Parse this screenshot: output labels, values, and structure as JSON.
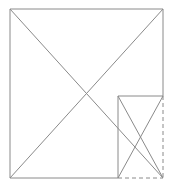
{
  "canvas": {
    "width": 172,
    "height": 188,
    "background": "#ffffff"
  },
  "style": {
    "stroke_color": "#8a8a8a",
    "stroke_width": 1,
    "dash_pattern": "4 3"
  },
  "diagram": {
    "big_rect": {
      "x1": 10,
      "y1": 9,
      "x2": 163,
      "y2": 178
    },
    "small_rect": {
      "x1": 118,
      "y1": 96,
      "x2": 163,
      "y2": 178
    },
    "lines": [
      {
        "name": "big-square-top-edge",
        "x1": 10,
        "y1": 9,
        "x2": 163,
        "y2": 9,
        "dashed": false
      },
      {
        "name": "big-square-left-edge",
        "x1": 10,
        "y1": 9,
        "x2": 10,
        "y2": 178,
        "dashed": false
      },
      {
        "name": "big-square-bottom-edge-solid",
        "x1": 10,
        "y1": 178,
        "x2": 118,
        "y2": 178,
        "dashed": false
      },
      {
        "name": "big-square-right-edge-solid",
        "x1": 163,
        "y1": 9,
        "x2": 163,
        "y2": 96,
        "dashed": false
      },
      {
        "name": "big-square-diagonal-tl-br",
        "x1": 10,
        "y1": 9,
        "x2": 163,
        "y2": 178,
        "dashed": false
      },
      {
        "name": "big-square-diagonal-bl-tr",
        "x1": 10,
        "y1": 178,
        "x2": 163,
        "y2": 9,
        "dashed": false
      },
      {
        "name": "small-rect-top-edge",
        "x1": 118,
        "y1": 96,
        "x2": 163,
        "y2": 96,
        "dashed": false
      },
      {
        "name": "small-rect-left-edge",
        "x1": 118,
        "y1": 96,
        "x2": 118,
        "y2": 178,
        "dashed": false
      },
      {
        "name": "small-rect-diagonal-tl-br",
        "x1": 118,
        "y1": 96,
        "x2": 163,
        "y2": 178,
        "dashed": false
      },
      {
        "name": "small-rect-diagonal-tr-bl",
        "x1": 163,
        "y1": 96,
        "x2": 118,
        "y2": 178,
        "dashed": false
      },
      {
        "name": "small-rect-right-edge-dashed",
        "x1": 163,
        "y1": 96,
        "x2": 163,
        "y2": 178,
        "dashed": true
      },
      {
        "name": "small-rect-bottom-edge-dashed",
        "x1": 118,
        "y1": 178,
        "x2": 163,
        "y2": 178,
        "dashed": true
      }
    ]
  }
}
